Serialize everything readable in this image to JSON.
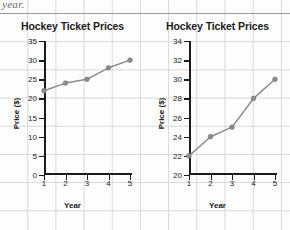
{
  "page": {
    "clipped_text": "year.",
    "background": "#fdfdfd",
    "grid_color": "#d8d8d8"
  },
  "chart_data": [
    {
      "type": "line",
      "title": "Hockey Ticket Prices",
      "xlabel": "Year",
      "ylabel": "Price ($)",
      "x": [
        1,
        2,
        3,
        4,
        5
      ],
      "values": [
        22,
        24,
        25,
        28,
        30
      ],
      "categories": [
        "1",
        "2",
        "3",
        "4",
        "5"
      ],
      "xlim": [
        1,
        5
      ],
      "ylim": [
        0,
        35
      ],
      "yticks": [
        0,
        5,
        10,
        15,
        20,
        25,
        30,
        35
      ],
      "ytick_labels": [
        "0",
        "5",
        "10",
        "15",
        "20",
        "25",
        "30",
        "35"
      ],
      "xticks": [
        1,
        2,
        3,
        4,
        5
      ],
      "xtick_labels": [
        "1",
        "2",
        "3",
        "4",
        "5"
      ],
      "grid": false,
      "legend": "none",
      "line_color": "#8c8c8c",
      "marker_color": "#8c8c8c",
      "axis_color": "#1b1b1b"
    },
    {
      "type": "line",
      "title": "Hockey Ticket Prices",
      "xlabel": "Year",
      "ylabel": "Price ($)",
      "x": [
        1,
        2,
        3,
        4,
        5
      ],
      "values": [
        22,
        24,
        25,
        28,
        30
      ],
      "categories": [
        "1",
        "2",
        "3",
        "4",
        "5"
      ],
      "xlim": [
        1,
        5
      ],
      "ylim": [
        20,
        34
      ],
      "yticks": [
        20,
        22,
        24,
        26,
        28,
        30,
        32,
        34
      ],
      "ytick_labels": [
        "20",
        "22",
        "24",
        "26",
        "28",
        "30",
        "32",
        "34"
      ],
      "xticks": [
        1,
        2,
        3,
        4,
        5
      ],
      "xtick_labels": [
        "1",
        "2",
        "3",
        "4",
        "5"
      ],
      "grid": false,
      "legend": "none",
      "line_color": "#8c8c8c",
      "marker_color": "#8c8c8c",
      "axis_color": "#1b1b1b"
    }
  ]
}
